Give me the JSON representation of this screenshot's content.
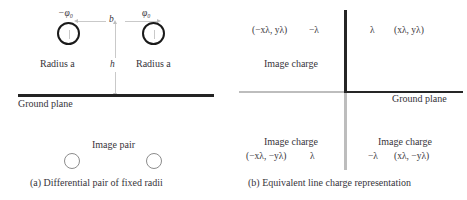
{
  "figure": {
    "panel_a": {
      "caption": "(a) Differential pair of fixed radii",
      "labels": {
        "left_potential": "−φ₀",
        "right_potential": "φ₀",
        "separation": "b",
        "height": "h",
        "left_radius": "Radius a",
        "right_radius": "Radius a",
        "ground_plane": "Ground plane",
        "image_pair": "Image pair"
      },
      "colors": {
        "conductor_outline": "#1a1a1a",
        "image_outline": "#8c8c8c",
        "ground_plane": "#232323",
        "dimension_line": "#c9c9c9"
      }
    },
    "panel_b": {
      "caption": "(b) Equivalent line charge representation",
      "labels": {
        "top_left_coords": "(−xλ, yλ)",
        "top_left_charge": "−λ",
        "top_right_charge": "λ",
        "top_right_coords": "(xλ, yλ)",
        "mid_left_image": "Image charge",
        "ground_plane": "Ground plane",
        "bottom_left_image": "Image charge",
        "bottom_left_coords": "(−xλ, −yλ)",
        "bottom_left_charge": "λ",
        "bottom_right_image": "Image charge",
        "bottom_right_charge": "−λ",
        "bottom_right_coords": "(xλ, −yλ)"
      },
      "colors": {
        "axis_dark": "#262626",
        "axis_light": "#bdbdbd",
        "divider": "#c4c4c4"
      }
    }
  }
}
